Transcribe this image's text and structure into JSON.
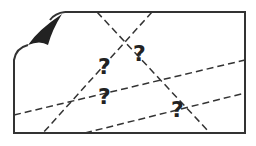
{
  "illustration": {
    "description": "unknown-map icon",
    "colors": {
      "stroke": "#333333",
      "fill": "#222222",
      "background": "#ffffff"
    },
    "question_marks": [
      {
        "text": "?",
        "x": 98,
        "y": 74
      },
      {
        "text": "?",
        "x": 133,
        "y": 61
      },
      {
        "text": "?",
        "x": 98,
        "y": 104
      },
      {
        "text": "?",
        "x": 171,
        "y": 117
      }
    ]
  }
}
